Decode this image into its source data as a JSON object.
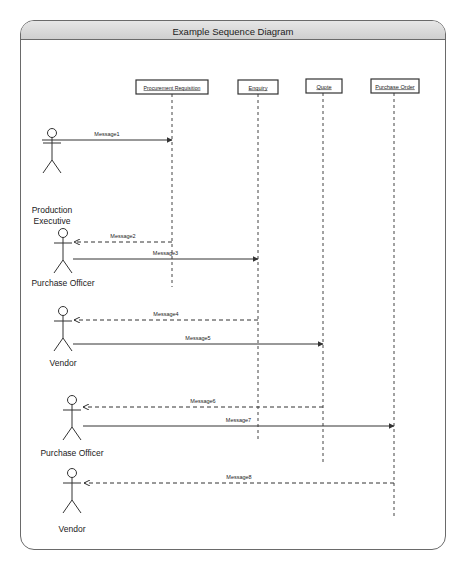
{
  "diagram": {
    "title": "Example Sequence Diagram",
    "type": "UML sequence diagram",
    "objects": [
      {
        "id": "pr",
        "label": "Procurement Requisition",
        "x": 172,
        "box": [
          136,
          80,
          72,
          14
        ],
        "lifeline_end": 287
      },
      {
        "id": "enq",
        "label": "Enquiry",
        "x": 258,
        "box": [
          238,
          80,
          40,
          14
        ],
        "lifeline_end": 442
      },
      {
        "id": "quote",
        "label": "Quote",
        "x": 323,
        "box": [
          306,
          79,
          36,
          14
        ],
        "lifeline_end": 463
      },
      {
        "id": "po",
        "label": "Purchase Order",
        "x": 394,
        "box": [
          371,
          79,
          48,
          14
        ],
        "lifeline_end": 518
      }
    ],
    "actors": [
      {
        "id": "a1",
        "label_lines": [
          "Production",
          "Executive"
        ],
        "x": 52,
        "head_y": 133,
        "label_y": 213
      },
      {
        "id": "a2",
        "label_lines": [
          "Purchase Officer"
        ],
        "x": 63,
        "head_y": 233,
        "label_y": 286
      },
      {
        "id": "a3",
        "label_lines": [
          "Vendor"
        ],
        "x": 63,
        "head_y": 311,
        "label_y": 366
      },
      {
        "id": "a4",
        "label_lines": [
          "Purchase Officer"
        ],
        "x": 72,
        "head_y": 400,
        "label_y": 456
      },
      {
        "id": "a5",
        "label_lines": [
          "Vendor"
        ],
        "x": 72,
        "head_y": 473,
        "label_y": 532
      }
    ],
    "messages": [
      {
        "label": "Message1",
        "from_x": 42,
        "to_x": 172,
        "y": 140,
        "style": "sync",
        "dir": "right"
      },
      {
        "label": "Message2",
        "from_x": 172,
        "to_x": 74,
        "y": 242,
        "style": "return",
        "dir": "left"
      },
      {
        "label": "Message3",
        "from_x": 73,
        "to_x": 258,
        "y": 259,
        "style": "sync",
        "dir": "right"
      },
      {
        "label": "Message4",
        "from_x": 258,
        "to_x": 74,
        "y": 320,
        "style": "return",
        "dir": "left"
      },
      {
        "label": "Message5",
        "from_x": 73,
        "to_x": 323,
        "y": 344,
        "style": "sync",
        "dir": "right"
      },
      {
        "label": "Message6",
        "from_x": 323,
        "to_x": 83,
        "y": 407,
        "style": "return",
        "dir": "left"
      },
      {
        "label": "Message7",
        "from_x": 83,
        "to_x": 394,
        "y": 426,
        "style": "sync",
        "dir": "right"
      },
      {
        "label": "Message8",
        "from_x": 394,
        "to_x": 84,
        "y": 483,
        "style": "return",
        "dir": "left"
      }
    ]
  }
}
